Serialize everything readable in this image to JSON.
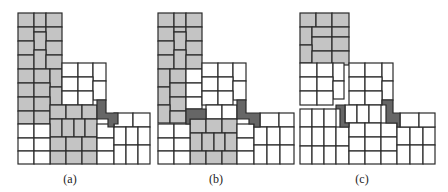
{
  "colors": {
    "white": "#ffffff",
    "gray": "#c4c4c4",
    "dark": "#666666",
    "stroke": "#2a2a2a"
  },
  "panels": [
    {
      "label": "(a)",
      "label_x": 64,
      "rects": [
        [
          18,
          13,
          16,
          14,
          "gray"
        ],
        [
          34,
          13,
          12,
          14,
          "gray"
        ],
        [
          46,
          13,
          16,
          14,
          "gray"
        ],
        [
          18,
          27,
          16,
          14,
          "gray"
        ],
        [
          34,
          27,
          12,
          5,
          "gray"
        ],
        [
          46,
          27,
          16,
          14,
          "gray"
        ],
        [
          34,
          32,
          12,
          18,
          "gray"
        ],
        [
          18,
          41,
          16,
          14,
          "gray"
        ],
        [
          46,
          41,
          16,
          14,
          "gray"
        ],
        [
          18,
          55,
          16,
          14,
          "gray"
        ],
        [
          34,
          50,
          12,
          19,
          "gray"
        ],
        [
          46,
          55,
          16,
          14,
          "gray"
        ],
        [
          18,
          69,
          16,
          14,
          "gray"
        ],
        [
          34,
          69,
          16,
          14,
          "gray"
        ],
        [
          50,
          69,
          12,
          18,
          "gray"
        ],
        [
          18,
          83,
          16,
          14,
          "gray"
        ],
        [
          34,
          83,
          16,
          14,
          "gray"
        ],
        [
          50,
          87,
          12,
          18,
          "gray"
        ],
        [
          18,
          97,
          16,
          14,
          "gray"
        ],
        [
          34,
          97,
          16,
          14,
          "gray"
        ],
        [
          18,
          111,
          16,
          13,
          "gray"
        ],
        [
          34,
          111,
          16,
          13,
          "gray"
        ],
        [
          62,
          63,
          16,
          14,
          "white"
        ],
        [
          78,
          63,
          15,
          14,
          "white"
        ],
        [
          93,
          63,
          13,
          18,
          "white"
        ],
        [
          62,
          77,
          16,
          14,
          "white"
        ],
        [
          78,
          77,
          15,
          14,
          "white"
        ],
        [
          93,
          81,
          13,
          19,
          "white"
        ],
        [
          62,
          91,
          16,
          14,
          "white"
        ],
        [
          78,
          91,
          15,
          14,
          "white"
        ],
        [
          50,
          105,
          16,
          14,
          "gray"
        ],
        [
          66,
          105,
          16,
          14,
          "gray"
        ],
        [
          82,
          105,
          15,
          14,
          "gray"
        ],
        [
          50,
          119,
          12,
          18,
          "gray"
        ],
        [
          62,
          119,
          12,
          18,
          "gray"
        ],
        [
          74,
          119,
          11,
          18,
          "gray"
        ],
        [
          85,
          119,
          12,
          18,
          "gray"
        ],
        [
          50,
          137,
          16,
          14,
          "gray"
        ],
        [
          66,
          137,
          16,
          14,
          "gray"
        ],
        [
          82,
          137,
          15,
          14,
          "gray"
        ],
        [
          50,
          151,
          16,
          13,
          "gray"
        ],
        [
          66,
          151,
          16,
          13,
          "gray"
        ],
        [
          82,
          151,
          15,
          13,
          "gray"
        ],
        [
          18,
          124,
          16,
          14,
          "white"
        ],
        [
          34,
          124,
          16,
          14,
          "white"
        ],
        [
          18,
          138,
          16,
          13,
          "white"
        ],
        [
          34,
          138,
          16,
          13,
          "white"
        ],
        [
          18,
          151,
          16,
          13,
          "white"
        ],
        [
          34,
          151,
          16,
          13,
          "white"
        ],
        [
          97,
          124,
          17,
          14,
          "white"
        ],
        [
          97,
          138,
          17,
          13,
          "white"
        ],
        [
          97,
          151,
          17,
          13,
          "white"
        ],
        [
          114,
          113,
          19,
          14,
          "white"
        ],
        [
          133,
          113,
          17,
          14,
          "white"
        ],
        [
          114,
          127,
          12,
          18,
          "white"
        ],
        [
          126,
          127,
          12,
          18,
          "white"
        ],
        [
          138,
          127,
          12,
          18,
          "white"
        ],
        [
          114,
          145,
          12,
          19,
          "white"
        ],
        [
          126,
          145,
          12,
          19,
          "white"
        ],
        [
          138,
          145,
          12,
          19,
          "white"
        ]
      ],
      "polys": [
        [
          "97,100 106,100 106,113 118,113 118,124 114,124 114,127 108,127 108,119 97,119",
          "dark"
        ]
      ]
    },
    {
      "label": "(b)",
      "label_x": 200,
      "rects": [
        [
          158,
          13,
          16,
          14,
          "gray"
        ],
        [
          174,
          13,
          12,
          14,
          "gray"
        ],
        [
          186,
          13,
          16,
          14,
          "gray"
        ],
        [
          158,
          27,
          16,
          14,
          "gray"
        ],
        [
          174,
          27,
          12,
          5,
          "gray"
        ],
        [
          186,
          27,
          16,
          14,
          "gray"
        ],
        [
          174,
          32,
          12,
          18,
          "gray"
        ],
        [
          158,
          41,
          16,
          14,
          "gray"
        ],
        [
          186,
          41,
          16,
          14,
          "gray"
        ],
        [
          158,
          55,
          16,
          14,
          "gray"
        ],
        [
          174,
          50,
          12,
          19,
          "gray"
        ],
        [
          186,
          55,
          16,
          14,
          "gray"
        ],
        [
          158,
          69,
          12,
          18,
          "gray"
        ],
        [
          170,
          69,
          16,
          14,
          "gray"
        ],
        [
          186,
          69,
          16,
          14,
          "white"
        ],
        [
          158,
          87,
          12,
          18,
          "gray"
        ],
        [
          170,
          83,
          16,
          14,
          "gray"
        ],
        [
          186,
          83,
          16,
          14,
          "white"
        ],
        [
          170,
          97,
          16,
          14,
          "gray"
        ],
        [
          186,
          97,
          16,
          12,
          "white"
        ],
        [
          158,
          105,
          12,
          18,
          "gray"
        ],
        [
          170,
          111,
          16,
          12,
          "gray"
        ],
        [
          202,
          63,
          16,
          14,
          "white"
        ],
        [
          218,
          63,
          15,
          14,
          "white"
        ],
        [
          233,
          63,
          13,
          18,
          "white"
        ],
        [
          202,
          77,
          16,
          14,
          "white"
        ],
        [
          218,
          77,
          15,
          14,
          "white"
        ],
        [
          233,
          81,
          13,
          19,
          "white"
        ],
        [
          202,
          91,
          16,
          14,
          "white"
        ],
        [
          218,
          91,
          15,
          14,
          "white"
        ],
        [
          206,
          105,
          16,
          14,
          "white"
        ],
        [
          222,
          105,
          15,
          14,
          "white"
        ],
        [
          190,
          119,
          16,
          14,
          "gray"
        ],
        [
          206,
          119,
          16,
          14,
          "gray"
        ],
        [
          222,
          119,
          15,
          14,
          "gray"
        ],
        [
          190,
          133,
          12,
          18,
          "gray"
        ],
        [
          202,
          133,
          12,
          18,
          "gray"
        ],
        [
          214,
          133,
          11,
          18,
          "gray"
        ],
        [
          225,
          133,
          12,
          18,
          "gray"
        ],
        [
          190,
          151,
          16,
          13,
          "gray"
        ],
        [
          206,
          151,
          16,
          13,
          "gray"
        ],
        [
          222,
          151,
          15,
          13,
          "gray"
        ],
        [
          158,
          124,
          16,
          14,
          "white"
        ],
        [
          174,
          124,
          16,
          14,
          "white"
        ],
        [
          158,
          138,
          16,
          13,
          "white"
        ],
        [
          174,
          138,
          16,
          13,
          "white"
        ],
        [
          158,
          151,
          16,
          13,
          "white"
        ],
        [
          174,
          151,
          16,
          13,
          "white"
        ],
        [
          237,
          124,
          17,
          14,
          "white"
        ],
        [
          237,
          138,
          17,
          13,
          "white"
        ],
        [
          237,
          151,
          17,
          13,
          "white"
        ],
        [
          260,
          113,
          19,
          14,
          "white"
        ],
        [
          279,
          113,
          15,
          14,
          "white"
        ],
        [
          254,
          127,
          13,
          18,
          "white"
        ],
        [
          267,
          127,
          13,
          18,
          "white"
        ],
        [
          280,
          127,
          14,
          18,
          "white"
        ],
        [
          254,
          145,
          13,
          19,
          "white"
        ],
        [
          267,
          145,
          13,
          19,
          "white"
        ],
        [
          280,
          145,
          14,
          19,
          "white"
        ]
      ],
      "polys": [
        [
          "186,109 206,109 206,119 190,119 190,124 186,124",
          "dark"
        ],
        [
          "237,100 246,100 246,113 260,113 260,127 254,127 254,124 249,124 249,119 237,119",
          "dark"
        ]
      ]
    },
    {
      "label": "(c)",
      "label_x": 346,
      "rects": [
        [
          300,
          13,
          16,
          14,
          "gray"
        ],
        [
          316,
          13,
          16,
          14,
          "gray"
        ],
        [
          332,
          13,
          17,
          14,
          "gray"
        ],
        [
          300,
          27,
          12,
          18,
          "gray"
        ],
        [
          312,
          27,
          20,
          10,
          "gray"
        ],
        [
          332,
          27,
          17,
          10,
          "gray"
        ],
        [
          312,
          37,
          20,
          14,
          "gray"
        ],
        [
          332,
          37,
          17,
          14,
          "gray"
        ],
        [
          300,
          45,
          12,
          18,
          "gray"
        ],
        [
          312,
          51,
          20,
          14,
          "gray"
        ],
        [
          332,
          51,
          17,
          14,
          "gray"
        ],
        [
          300,
          63,
          49,
          0,
          "gray"
        ],
        [
          300,
          63,
          17,
          14,
          "white"
        ],
        [
          317,
          63,
          16,
          14,
          "white"
        ],
        [
          333,
          63,
          11,
          18,
          "white"
        ],
        [
          300,
          77,
          17,
          14,
          "white"
        ],
        [
          317,
          77,
          16,
          14,
          "white"
        ],
        [
          333,
          81,
          11,
          18,
          "white"
        ],
        [
          300,
          91,
          17,
          14,
          "white"
        ],
        [
          317,
          91,
          16,
          14,
          "white"
        ],
        [
          349,
          63,
          16,
          14,
          "white"
        ],
        [
          365,
          63,
          17,
          14,
          "white"
        ],
        [
          382,
          63,
          11,
          18,
          "white"
        ],
        [
          349,
          77,
          16,
          14,
          "white"
        ],
        [
          365,
          77,
          17,
          14,
          "white"
        ],
        [
          382,
          81,
          11,
          19,
          "white"
        ],
        [
          349,
          91,
          16,
          14,
          "white"
        ],
        [
          365,
          91,
          17,
          14,
          "white"
        ],
        [
          345,
          105,
          12,
          18,
          "white"
        ],
        [
          357,
          105,
          12,
          18,
          "white"
        ],
        [
          369,
          105,
          12,
          18,
          "white"
        ],
        [
          300,
          109,
          12,
          18,
          "white"
        ],
        [
          312,
          109,
          12,
          18,
          "white"
        ],
        [
          324,
          109,
          12,
          18,
          "white"
        ],
        [
          300,
          127,
          12,
          19,
          "white"
        ],
        [
          312,
          127,
          12,
          19,
          "white"
        ],
        [
          324,
          127,
          12,
          19,
          "white"
        ],
        [
          336,
          127,
          13,
          19,
          "white"
        ],
        [
          300,
          146,
          12,
          18,
          "white"
        ],
        [
          312,
          146,
          12,
          18,
          "white"
        ],
        [
          324,
          146,
          12,
          18,
          "white"
        ],
        [
          336,
          146,
          13,
          18,
          "white"
        ],
        [
          349,
          123,
          16,
          14,
          "white"
        ],
        [
          365,
          123,
          16,
          14,
          "white"
        ],
        [
          381,
          123,
          16,
          14,
          "white"
        ],
        [
          349,
          137,
          16,
          14,
          "white"
        ],
        [
          365,
          137,
          16,
          14,
          "white"
        ],
        [
          381,
          137,
          16,
          14,
          "white"
        ],
        [
          349,
          151,
          16,
          13,
          "white"
        ],
        [
          365,
          151,
          16,
          13,
          "white"
        ],
        [
          381,
          151,
          16,
          13,
          "white"
        ],
        [
          397,
          127,
          13,
          18,
          "white"
        ],
        [
          410,
          127,
          13,
          18,
          "white"
        ],
        [
          423,
          127,
          12,
          18,
          "white"
        ],
        [
          397,
          145,
          13,
          19,
          "white"
        ],
        [
          410,
          145,
          13,
          19,
          "white"
        ],
        [
          423,
          145,
          12,
          19,
          "white"
        ],
        [
          400,
          113,
          19,
          14,
          "white"
        ],
        [
          419,
          113,
          16,
          14,
          "white"
        ]
      ],
      "polys": [
        [
          "336,105 345,105 345,123 349,123 349,127 340,127 340,109 336,109",
          "dark"
        ],
        [
          "382,100 393,100 393,113 400,113 400,127 397,127 397,123 386,123 386,105 382,105",
          "dark"
        ]
      ]
    }
  ]
}
